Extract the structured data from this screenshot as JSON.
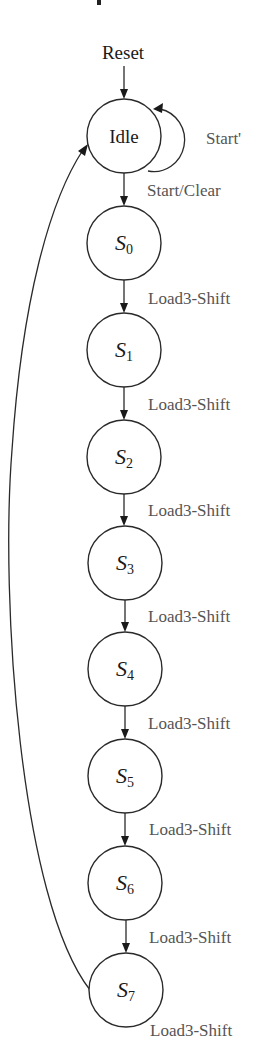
{
  "diagram": {
    "type": "state-machine",
    "entry": {
      "label": "Reset",
      "target": "Idle"
    },
    "states": [
      {
        "id": "Idle",
        "label": "Idle",
        "sub": ""
      },
      {
        "id": "S0",
        "label": "S",
        "sub": "0"
      },
      {
        "id": "S1",
        "label": "S",
        "sub": "1"
      },
      {
        "id": "S2",
        "label": "S",
        "sub": "2"
      },
      {
        "id": "S3",
        "label": "S",
        "sub": "3"
      },
      {
        "id": "S4",
        "label": "S",
        "sub": "4"
      },
      {
        "id": "S5",
        "label": "S",
        "sub": "5"
      },
      {
        "id": "S6",
        "label": "S",
        "sub": "6"
      },
      {
        "id": "S7",
        "label": "S",
        "sub": "7"
      }
    ],
    "transitions": [
      {
        "from": "Idle",
        "to": "Idle",
        "label": "Start'"
      },
      {
        "from": "Idle",
        "to": "S0",
        "label": "Start/Clear"
      },
      {
        "from": "S0",
        "to": "S1",
        "label": "Load3-Shift"
      },
      {
        "from": "S1",
        "to": "S2",
        "label": "Load3-Shift"
      },
      {
        "from": "S2",
        "to": "S3",
        "label": "Load3-Shift"
      },
      {
        "from": "S3",
        "to": "S4",
        "label": "Load3-Shift"
      },
      {
        "from": "S4",
        "to": "S5",
        "label": "Load3-Shift"
      },
      {
        "from": "S5",
        "to": "S6",
        "label": "Load3-Shift"
      },
      {
        "from": "S6",
        "to": "S7",
        "label": "Load3-Shift"
      },
      {
        "from": "S7",
        "to": "Idle",
        "label": "Load3-Shift"
      }
    ]
  }
}
